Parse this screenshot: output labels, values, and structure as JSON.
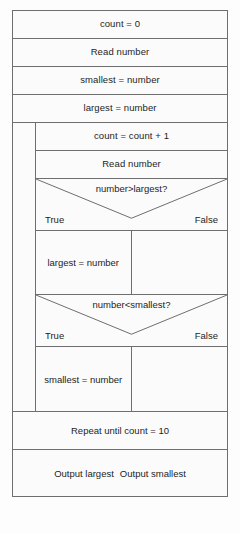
{
  "diagram": {
    "type": "nassi-shneiderman-structured-flowchart",
    "colors": {
      "line": "#6e6e6e",
      "text": "#1d1d1d",
      "background": "#fbfbfb",
      "page": "#fdfdfd"
    },
    "preamble": [
      {
        "id": "init-count",
        "text": "count = 0"
      },
      {
        "id": "read-first",
        "text": "Read number"
      },
      {
        "id": "init-smallest",
        "text": "smallest = number"
      },
      {
        "id": "init-largest",
        "text": "largest = number"
      }
    ],
    "loop": {
      "body": [
        {
          "id": "increment-count",
          "text": "count = count + 1"
        },
        {
          "id": "read-number",
          "text": "Read number"
        }
      ],
      "decisions": [
        {
          "id": "largest-test",
          "condition": "number>largest?",
          "true_label": "True",
          "false_label": "False",
          "true_body": "largest = number",
          "false_body": ""
        },
        {
          "id": "smallest-test",
          "condition": "number<smallest?",
          "true_label": "True",
          "false_label": "False",
          "true_body": "smallest = number",
          "false_body": ""
        }
      ],
      "footer": "Repeat until count = 10"
    },
    "output": {
      "largest": "Output largest",
      "smallest": "Output smallest"
    }
  }
}
